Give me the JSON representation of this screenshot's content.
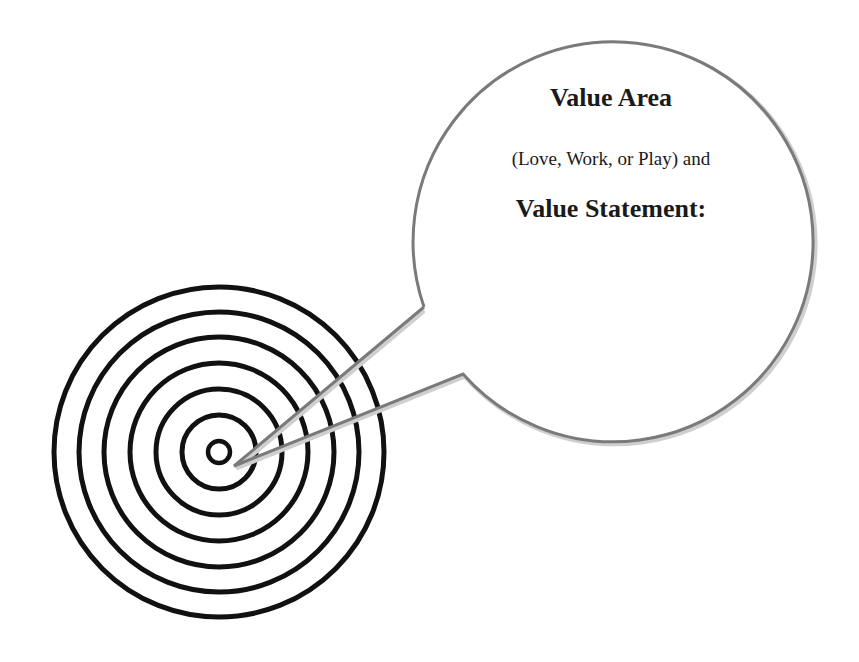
{
  "bubble": {
    "title": "Value Area",
    "subtitle": "(Love, Work, or Play) and",
    "statement_label": "Value Statement:"
  },
  "target": {
    "icon": "target-icon",
    "ring_count": 7
  },
  "colors": {
    "rings": "#111111",
    "bubble_outline": "#7a7a7a",
    "background": "#ffffff"
  }
}
